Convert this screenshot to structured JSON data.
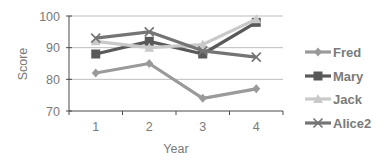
{
  "chart_data": {
    "type": "line",
    "title": "",
    "xlabel": "Year",
    "ylabel": "Score",
    "categories": [
      "1",
      "2",
      "3",
      "4"
    ],
    "ylim": [
      70,
      100
    ],
    "yticks": [
      70,
      80,
      90,
      100
    ],
    "grid": true,
    "legend_position": "right",
    "series": [
      {
        "name": "Fred",
        "values": [
          82,
          85,
          74,
          77
        ],
        "color": "#9a9a9a",
        "marker": "diamond"
      },
      {
        "name": "Mary",
        "values": [
          88,
          92,
          88,
          98
        ],
        "color": "#595959",
        "marker": "square"
      },
      {
        "name": "Jack",
        "values": [
          92,
          90,
          91,
          99
        ],
        "color": "#c9c9c9",
        "marker": "triangle"
      },
      {
        "name": "Alice2",
        "values": [
          93,
          95,
          89,
          87
        ],
        "color": "#747474",
        "marker": "x"
      }
    ]
  },
  "colors": {
    "grid": "#bdbdbd",
    "axis": "#4a4a4a",
    "text": "#7a7a7a"
  }
}
